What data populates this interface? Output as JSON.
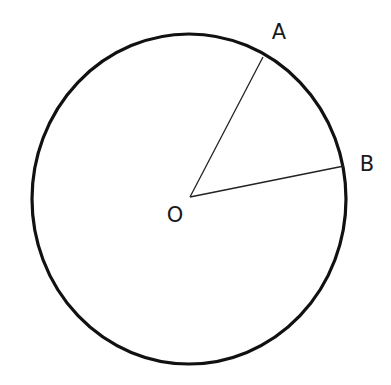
{
  "diagram": {
    "type": "circle-with-radii",
    "circle": {
      "cx": 189,
      "cy": 199,
      "rx": 157,
      "ry": 165,
      "stroke": "#111111",
      "stroke_width": 3.2
    },
    "center": {
      "name": "O",
      "x": 190,
      "y": 197,
      "label_x": 175,
      "label_y": 222
    },
    "points": [
      {
        "name": "A",
        "x": 263,
        "y": 57,
        "label_x": 279,
        "label_y": 39
      },
      {
        "name": "B",
        "x": 344,
        "y": 166,
        "label_x": 367,
        "label_y": 171
      }
    ],
    "segments": [
      {
        "from": "O",
        "to": "A"
      },
      {
        "from": "O",
        "to": "B"
      }
    ]
  },
  "labels": {
    "center": "O",
    "a": "A",
    "b": "B"
  }
}
